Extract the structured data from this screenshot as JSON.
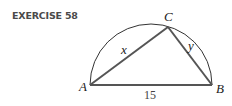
{
  "exercise": {
    "title": "EXERCISE 58"
  },
  "figure": {
    "vertices": {
      "A": "A",
      "B": "B",
      "C": "C"
    },
    "sides": {
      "AC": "x",
      "BC": "y",
      "AB": "15"
    },
    "colors": {
      "triangle": "#555555",
      "arc": "#333333"
    }
  }
}
